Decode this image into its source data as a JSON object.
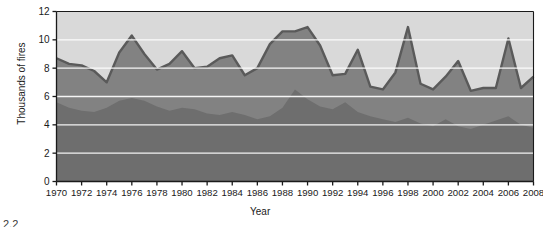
{
  "chart_data": {
    "type": "area",
    "title": "",
    "xlabel": "Year",
    "ylabel": "Thousands of fires",
    "stacked": true,
    "grid": true,
    "legend": "none",
    "xlim": [
      1970,
      2008
    ],
    "ylim": [
      0,
      12
    ],
    "yticks": [
      0,
      2,
      4,
      6,
      8,
      10,
      12
    ],
    "xticks": [
      1970,
      1972,
      1974,
      1976,
      1978,
      1980,
      1982,
      1984,
      1986,
      1988,
      1990,
      1992,
      1994,
      1996,
      1998,
      2000,
      2002,
      2004,
      2006,
      2008
    ],
    "x": [
      1970,
      1971,
      1972,
      1973,
      1974,
      1975,
      1976,
      1977,
      1978,
      1979,
      1980,
      1981,
      1982,
      1983,
      1984,
      1985,
      1986,
      1987,
      1988,
      1989,
      1990,
      1991,
      1992,
      1993,
      1994,
      1995,
      1996,
      1997,
      1998,
      1999,
      2000,
      2001,
      2002,
      2003,
      2004,
      2005,
      2006,
      2007,
      2008
    ],
    "series": [
      {
        "name": "bottom-band",
        "color": "#6e6e6e",
        "values": [
          5.6,
          5.2,
          5.0,
          4.9,
          5.2,
          5.7,
          5.9,
          5.7,
          5.3,
          5.0,
          5.2,
          5.1,
          4.8,
          4.7,
          4.9,
          4.7,
          4.4,
          4.6,
          5.2,
          6.5,
          5.8,
          5.3,
          5.1,
          5.6,
          4.9,
          4.6,
          4.4,
          4.2,
          4.5,
          4.1,
          3.9,
          4.4,
          3.9,
          3.7,
          4.0,
          4.3,
          4.6,
          4.0,
          3.8
        ]
      },
      {
        "name": "middle-band",
        "color": "#828282",
        "outline": "#5a5a5a",
        "values": [
          3.1,
          3.1,
          3.2,
          2.9,
          1.8,
          3.4,
          4.4,
          3.3,
          2.6,
          3.3,
          4.0,
          2.9,
          3.3,
          4.0,
          4.0,
          2.8,
          3.6,
          5.1,
          5.4,
          4.1,
          5.1,
          4.3,
          2.4,
          2.0,
          4.4,
          2.1,
          2.1,
          3.5,
          6.4,
          2.8,
          2.6,
          3.0,
          4.6,
          2.7,
          2.6,
          2.3,
          5.5,
          2.6,
          3.6
        ]
      },
      {
        "name": "top-band",
        "color": "#d9d9d9",
        "values": [
          3.3,
          3.6,
          3.8,
          4.2,
          5.0,
          2.9,
          1.7,
          3.0,
          4.1,
          3.7,
          2.8,
          4.0,
          3.9,
          3.3,
          3.1,
          4.5,
          4.0,
          2.3,
          1.4,
          1.4,
          1.1,
          2.4,
          4.5,
          4.4,
          2.7,
          5.3,
          5.5,
          4.3,
          1.1,
          5.1,
          5.5,
          4.6,
          3.5,
          5.6,
          5.4,
          5.4,
          1.9,
          5.4,
          4.6
        ]
      }
    ]
  },
  "caption": "2.2"
}
